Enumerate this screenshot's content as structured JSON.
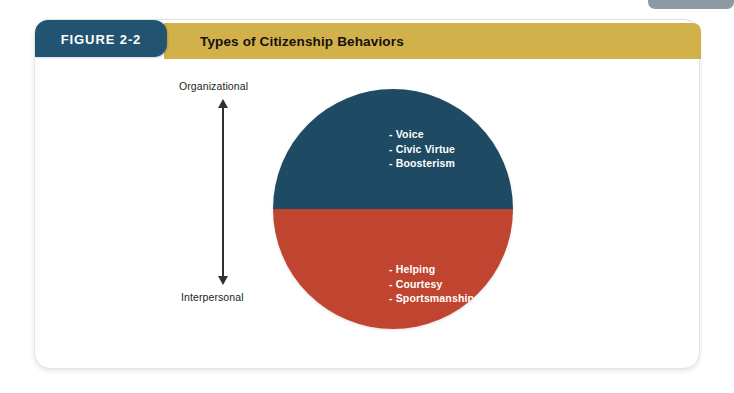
{
  "figure": {
    "tab_label": "FIGURE 2-2",
    "title": "Types of Citizenship Behaviors",
    "tab_color": "#225471",
    "banner_color": "#d3b14a"
  },
  "axis": {
    "top_label": "Organizational",
    "bottom_label": "Interpersonal",
    "arrow": "double-headed-vertical-arrow"
  },
  "diagram_data": {
    "type": "split-circle",
    "halves": [
      {
        "key": "organizational",
        "color": "#1e4a63",
        "position": "top",
        "items": [
          "- Voice",
          "- Civic Virtue",
          "- Boosterism"
        ]
      },
      {
        "key": "interpersonal",
        "color": "#bf4530",
        "position": "bottom",
        "items": [
          "- Helping",
          "- Courtesy",
          "- Sportsmanship"
        ]
      }
    ]
  }
}
